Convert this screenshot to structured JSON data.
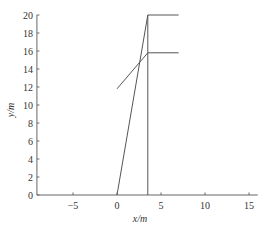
{
  "chart_data": {
    "type": "line",
    "title": "",
    "xlabel": "x/m",
    "ylabel": "y/m",
    "xlim": [
      -9.1,
      16
    ],
    "ylim": [
      0,
      20
    ],
    "xticks": [
      -5,
      0,
      5,
      10,
      15
    ],
    "yticks": [
      0,
      2,
      4,
      6,
      8,
      10,
      12,
      14,
      16,
      18,
      20
    ],
    "grid": false,
    "legend": null,
    "series": [
      {
        "name": "ground",
        "x": [
          -9.1,
          16
        ],
        "y": [
          0,
          0
        ]
      },
      {
        "name": "rising-line",
        "x": [
          0,
          3.5
        ],
        "y": [
          0,
          20
        ]
      },
      {
        "name": "vertical-line",
        "x": [
          3.5,
          3.5
        ],
        "y": [
          0,
          20
        ]
      },
      {
        "name": "top-horizontal",
        "x": [
          3.5,
          7
        ],
        "y": [
          20,
          20
        ]
      },
      {
        "name": "curve",
        "x": [
          0,
          3.5
        ],
        "y": [
          11.8,
          15.8
        ]
      },
      {
        "name": "mid-horizontal",
        "x": [
          3.5,
          7
        ],
        "y": [
          15.8,
          15.8
        ]
      }
    ]
  }
}
